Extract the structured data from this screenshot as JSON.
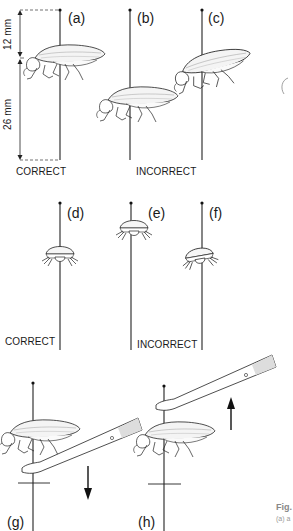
{
  "figure": {
    "panels": [
      {
        "id": "a",
        "label": "(a)"
      },
      {
        "id": "b",
        "label": "(b)"
      },
      {
        "id": "c",
        "label": "(c)"
      },
      {
        "id": "d",
        "label": "(d)"
      },
      {
        "id": "e",
        "label": "(e)"
      },
      {
        "id": "f",
        "label": "(f)"
      },
      {
        "id": "g",
        "label": "(g)"
      },
      {
        "id": "h",
        "label": "(h)"
      }
    ],
    "dimensions": {
      "top": "12 mm",
      "bottom": "26 mm"
    },
    "captions": {
      "row1_correct": "CORRECT",
      "row1_incorrect": "INCORRECT",
      "row2_correct": "CORRECT",
      "row2_incorrect": "INCORRECT"
    },
    "cutoff_caption": {
      "title": "Fig.",
      "sub": "(a) a"
    }
  }
}
